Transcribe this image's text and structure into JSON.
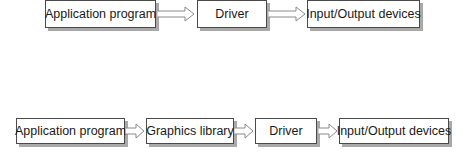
{
  "diagram": {
    "type": "flow",
    "row1": {
      "description": "Application without graphics library",
      "nodes": [
        {
          "id": "app1",
          "label": "Application program"
        },
        {
          "id": "driver1",
          "label": "Driver"
        },
        {
          "id": "io1",
          "label": "Input/Output devices"
        }
      ],
      "edges": [
        {
          "from": "app1",
          "to": "driver1"
        },
        {
          "from": "driver1",
          "to": "io1"
        }
      ]
    },
    "row2": {
      "description": "Application with graphics library",
      "nodes": [
        {
          "id": "app2",
          "label": "Application program"
        },
        {
          "id": "gfx2",
          "label": "Graphics library"
        },
        {
          "id": "driver2",
          "label": "Driver"
        },
        {
          "id": "io2",
          "label": "Input/Output devices"
        }
      ],
      "edges": [
        {
          "from": "app2",
          "to": "gfx2"
        },
        {
          "from": "gfx2",
          "to": "driver2"
        },
        {
          "from": "driver2",
          "to": "io2"
        }
      ]
    },
    "colors": {
      "box_border": "#4a4a4a",
      "box_shadow": "#a9a9a9",
      "arrow_stroke": "#8a8a8a",
      "text": "#1a1a1a",
      "background": "#ffffff"
    }
  }
}
